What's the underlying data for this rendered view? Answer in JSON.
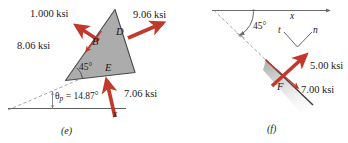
{
  "figure": {
    "panels": [
      {
        "id": "e",
        "caption": "(e)",
        "stress_arrows": [
          {
            "name": "normal-stress-upper-left",
            "label": "1.000 ksi"
          },
          {
            "name": "shear-stress-left",
            "label": "8.06 ksi"
          },
          {
            "name": "normal-stress-right",
            "label": "9.06 ksi"
          },
          {
            "name": "normal-stress-bottom",
            "label": "7.06 ksi"
          }
        ],
        "point_labels": [
          {
            "name": "point-B",
            "label": "B"
          },
          {
            "name": "point-D",
            "label": "D"
          },
          {
            "name": "point-E",
            "label": "E"
          }
        ],
        "angles": [
          {
            "name": "wedge-angle-45",
            "label": "45°"
          },
          {
            "name": "principal-angle",
            "label": "θ",
            "subscript": "p",
            "equals": " = 14.87°"
          }
        ],
        "axes": [
          {
            "name": "x-axis-label",
            "label": "x"
          }
        ]
      },
      {
        "id": "f",
        "caption": "(f)",
        "stress_arrows": [
          {
            "name": "normal-stress-n-direction",
            "label": "5.00 ksi"
          },
          {
            "name": "shear-stress-t-direction",
            "label": "7.00 ksi"
          }
        ],
        "point_labels": [
          {
            "name": "point-F",
            "label": "F"
          }
        ],
        "angles": [
          {
            "name": "plane-angle-45",
            "label": "45°"
          }
        ],
        "axes": [
          {
            "name": "x-axis-label",
            "label": "x"
          },
          {
            "name": "t-axis-label",
            "label": "t"
          },
          {
            "name": "n-axis-label",
            "label": "n"
          }
        ]
      }
    ],
    "colors": {
      "arrow_red": "#c0392b",
      "wedge_fill": "#a8a8a8",
      "wedge_stroke": "#4d4d4d",
      "line_gray": "#808080",
      "text": "#1a1a1a"
    }
  }
}
